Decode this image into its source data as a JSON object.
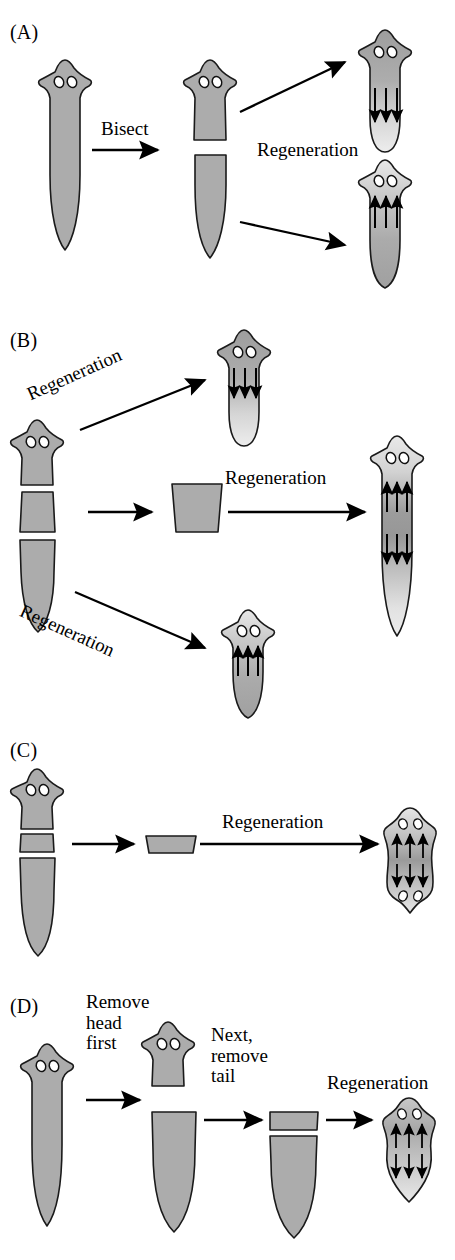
{
  "figure": {
    "type": "biology-diagram",
    "background_color": "#ffffff",
    "body_fill": "#acacac",
    "outline_color": "#1a1a1a",
    "eye_fill": "#ffffff",
    "arrow_color": "#000000"
  },
  "panels": [
    {
      "id": "A",
      "label": "(A)",
      "steps": [
        "Bisect",
        "Regeneration"
      ],
      "arrow_labels": {
        "bisect": "Bisect",
        "regeneration": "Regeneration"
      },
      "fragments": [
        "whole worm",
        "head half",
        "tail half"
      ],
      "results": [
        "head fragment regenerates tail (gradient high-to-low, arrows down)",
        "tail fragment regenerates head (gradient low-to-high, arrows up)"
      ]
    },
    {
      "id": "B",
      "label": "(B)",
      "arrow_labels": {
        "top": "Regeneration",
        "middle": "Regeneration",
        "bottom": "Regeneration"
      },
      "fragments": [
        "head piece",
        "middle trunk piece",
        "tail piece"
      ],
      "results": [
        "head piece regenerates tail (arrows down)",
        "middle piece regenerates both head and tail (arrows up and down)",
        "tail piece regenerates head (arrows up)"
      ]
    },
    {
      "id": "C",
      "label": "(C)",
      "arrow_labels": {
        "cut": "",
        "regeneration": "Regeneration"
      },
      "fragments": [
        "thin transverse slice"
      ],
      "results": [
        "bipolar form with two heads, arrows pointing outward both ways"
      ]
    },
    {
      "id": "D",
      "label": "(D)",
      "arrow_labels": {
        "step1": "Remove\nhead\nfirst",
        "step2": "Next,\nremove\ntail",
        "step3": "Regeneration"
      },
      "fragments": [
        "whole worm",
        "removed head",
        "decapitated body",
        "thin slice",
        "remaining tail"
      ],
      "results": [
        "slice regenerates a head with arrows up and down"
      ]
    }
  ],
  "labels": {
    "bisect": "Bisect",
    "regeneration": "Regeneration",
    "remove_head_first": "Remove\nhead\nfirst",
    "next_remove_tail": "Next,\nremove\ntail"
  }
}
